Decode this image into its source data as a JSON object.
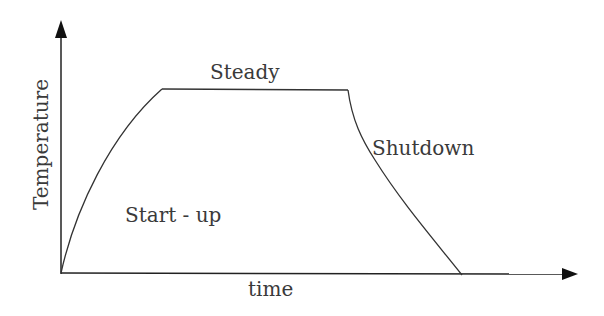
{
  "diagram": {
    "type": "temperature-time profile",
    "axes": {
      "x_label": "time",
      "y_label": "Temperature"
    },
    "phases": [
      {
        "label": "Start - up"
      },
      {
        "label": "Steady"
      },
      {
        "label": "Shutdown"
      }
    ],
    "colors": {
      "line": "#222222",
      "text": "#3a3a3a",
      "background": "#ffffff"
    }
  }
}
